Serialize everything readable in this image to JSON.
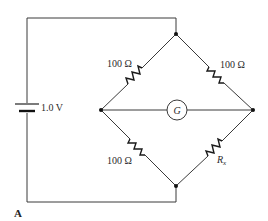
{
  "figure": {
    "panel_label": "A"
  },
  "battery": {
    "label": "1.0 V",
    "icon": "battery-icon"
  },
  "galvanometer": {
    "label": "G",
    "icon": "galvanometer-icon"
  },
  "resistors": {
    "top_left": {
      "label": "100 Ω"
    },
    "top_right": {
      "label": "100 Ω"
    },
    "bottom_left": {
      "label": "100 Ω"
    },
    "bottom_right": {
      "label": "R",
      "subscript": "x"
    }
  },
  "colors": {
    "wire": "#3a3a3a",
    "resistor": "#1a1a1a",
    "node": "#111111",
    "background": "#ffffff"
  }
}
